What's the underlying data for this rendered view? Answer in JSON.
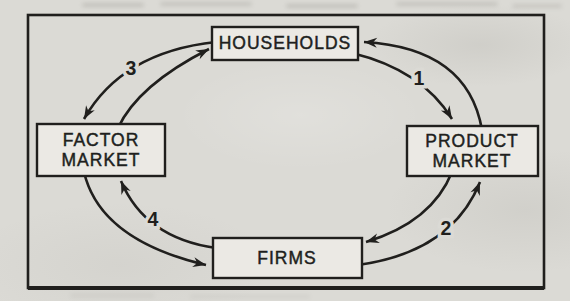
{
  "colors": {
    "ink": "#201f1d",
    "paper": "#dbdad5",
    "box_fill": "#ebe9e4"
  },
  "diagram": {
    "type": "circular-flow",
    "nodes": {
      "households": {
        "label": "HOUSEHOLDS"
      },
      "product_market": {
        "line1": "PRODUCT",
        "line2": "MARKET"
      },
      "firms": {
        "label": "FIRMS"
      },
      "factor_market": {
        "line1": "FACTOR",
        "line2": "MARKET"
      }
    },
    "flows": [
      {
        "number": "1",
        "from": "HOUSEHOLDS",
        "to": "PRODUCT MARKET"
      },
      {
        "number": "2",
        "from": "FIRMS",
        "to": "PRODUCT MARKET"
      },
      {
        "number": "3",
        "from": "HOUSEHOLDS",
        "to": "FACTOR MARKET"
      },
      {
        "number": "4",
        "from": "FIRMS",
        "to": "FACTOR MARKET"
      },
      {
        "number": "",
        "from": "PRODUCT MARKET",
        "to": "HOUSEHOLDS"
      },
      {
        "number": "",
        "from": "FACTOR MARKET",
        "to": "HOUSEHOLDS"
      },
      {
        "number": "",
        "from": "FACTOR MARKET",
        "to": "FIRMS"
      },
      {
        "number": "",
        "from": "PRODUCT MARKET",
        "to": "FIRMS"
      }
    ]
  }
}
